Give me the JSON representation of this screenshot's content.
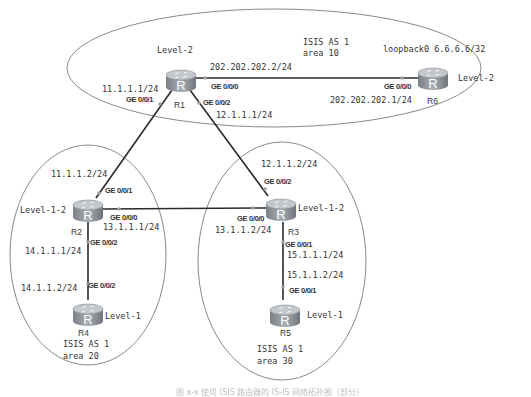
{
  "diagram": {
    "type": "network-topology",
    "colors": {
      "area_outline": "#8a8a8a",
      "link": "#2a2a2a",
      "router_body": "#8c9096",
      "router_top": "#b7bcc2",
      "text": "#333333"
    },
    "areas": [
      {
        "id": "area10",
        "label_line1": "ISIS AS 1",
        "label_line2": "area 10"
      },
      {
        "id": "area20",
        "label_line1": "ISIS AS 1",
        "label_line2": "area 20"
      },
      {
        "id": "area30",
        "label_line1": "ISIS AS 1",
        "label_line2": "area 30"
      }
    ],
    "routers": [
      {
        "id": "R1",
        "name": "R1",
        "level": "Level-2",
        "icon": "router-icon"
      },
      {
        "id": "R6",
        "name": "R6",
        "level": "Level-2",
        "icon": "router-icon",
        "loopback": "loopback0 6.6.6.6/32"
      },
      {
        "id": "R2",
        "name": "R2",
        "level": "Level-1-2",
        "icon": "router-icon"
      },
      {
        "id": "R3",
        "name": "R3",
        "level": "Level-1-2",
        "icon": "router-icon"
      },
      {
        "id": "R4",
        "name": "R4",
        "level": "Level-1",
        "icon": "router-icon"
      },
      {
        "id": "R5",
        "name": "R5",
        "level": "Level-1",
        "icon": "router-icon"
      }
    ],
    "links": [
      {
        "from": "R1",
        "from_port": "GE 0/0/0",
        "from_ip": "202.202.202.2/24",
        "to": "R6",
        "to_port": "GE 0/0/0",
        "to_ip": "202.202.202.1/24"
      },
      {
        "from": "R1",
        "from_port": "GE 0/0/1",
        "from_ip": "11.1.1.1/24",
        "to": "R2",
        "to_port": "GE 0/0/1",
        "to_ip": "11.1.1.2/24"
      },
      {
        "from": "R1",
        "from_port": "GE 0/0/2",
        "from_ip": "12.1.1.1/24",
        "to": "R3",
        "to_port": "GE 0/0/2",
        "to_ip": "12.1.1.2/24"
      },
      {
        "from": "R2",
        "from_port": "GE 0/0/0",
        "from_ip": "13.1.1.1/24",
        "to": "R3",
        "to_port": "GE 0/0/0",
        "to_ip": "13.1.1.2/24"
      },
      {
        "from": "R2",
        "from_port": "GE 0/0/2",
        "from_ip": "14.1.1.1/24",
        "to": "R4",
        "to_port": "GE 0/0/2",
        "to_ip": "14.1.1.2/24"
      },
      {
        "from": "R3",
        "from_port": "GE 0/0/1",
        "from_ip": "15.1.1.1/24",
        "to": "R5",
        "to_port": "GE 0/0/1",
        "to_ip": "15.1.1.2/24"
      }
    ],
    "caption": "图 x-x  使用 ISIS 路由器的 IS-IS 网络拓扑图（部分）"
  }
}
